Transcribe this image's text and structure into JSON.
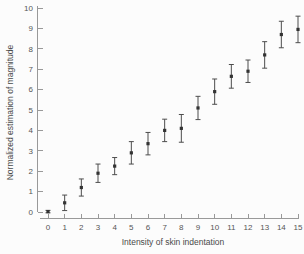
{
  "chart_data": {
    "type": "scatter",
    "title": "",
    "xlabel": "Intensity of skin indentation",
    "ylabel": "Normalized estimation of magnitude",
    "x": [
      0,
      1,
      2,
      3,
      4,
      5,
      6,
      7,
      8,
      9,
      10,
      11,
      12,
      13,
      14,
      15
    ],
    "y": [
      0.02,
      0.45,
      1.2,
      1.9,
      2.25,
      2.9,
      3.35,
      4.0,
      4.1,
      5.1,
      5.9,
      6.65,
      6.9,
      7.7,
      8.7,
      8.95
    ],
    "yerr": [
      0.06,
      0.38,
      0.42,
      0.45,
      0.42,
      0.55,
      0.55,
      0.55,
      0.68,
      0.57,
      0.62,
      0.58,
      0.55,
      0.65,
      0.65,
      0.65
    ],
    "xticks": [
      "0",
      "1",
      "2",
      "3",
      "4",
      "5",
      "6",
      "7",
      "8",
      "9",
      "10",
      "11",
      "12",
      "13",
      "14",
      "15"
    ],
    "yticks": [
      "0",
      "1",
      "2",
      "3",
      "4",
      "5",
      "6",
      "7",
      "8",
      "9",
      "10"
    ],
    "xlim": [
      0,
      15
    ],
    "ylim": [
      0,
      10
    ],
    "grid": false,
    "legend": null,
    "marker": "filled-square-with-error-bars",
    "colors": {
      "marker": "#333333",
      "error_bar": "#4d4d4d",
      "axis": "#999999",
      "tick_text": "#555555",
      "background": "#fcfcfc"
    }
  }
}
